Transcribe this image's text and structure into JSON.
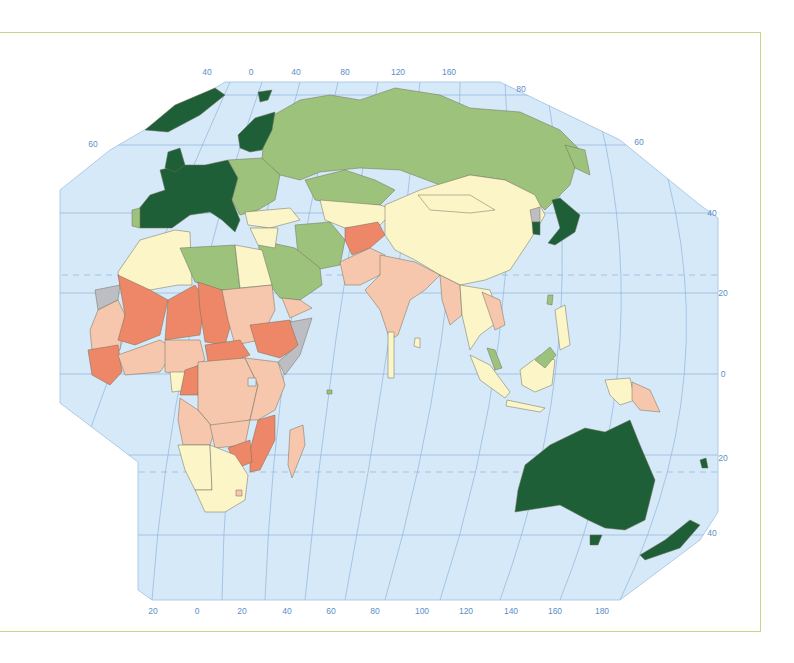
{
  "map": {
    "projection": "world map (Eastern Hemisphere, Africa / Eurasia / Oceania)",
    "colors": {
      "ocean": "#d6e9f8",
      "graticule": "#8fb4dc",
      "class_1_dark_green": "#1f5f37",
      "class_2_light_green": "#9dc27c",
      "class_3_pale_yellow": "#fbf5c8",
      "class_4_light_salmon": "#f6c6ad",
      "class_5_dark_salmon": "#ee8767",
      "no_data_grey": "#bdbec4",
      "frame_border": "#c9d48a"
    },
    "top_longitude_labels": [
      "40",
      "0",
      "40",
      "80",
      "120",
      "160"
    ],
    "bottom_longitude_labels": [
      "20",
      "0",
      "20",
      "40",
      "60",
      "80",
      "100",
      "120",
      "140",
      "160",
      "180"
    ],
    "right_latitude_labels": [
      "80",
      "60",
      "40",
      "20",
      "0",
      "20",
      "40"
    ],
    "left_latitude_labels": [
      "60"
    ],
    "regions": {
      "class_1_dark_green": [
        "Western Europe",
        "Scandinavia",
        "Greenland (partial)",
        "Svalbard",
        "Japan",
        "South Korea",
        "Australia",
        "New Zealand",
        "Israel"
      ],
      "class_2_light_green": [
        "Russia",
        "Eastern Europe",
        "Kazakhstan",
        "Libya",
        "Saudi Arabia",
        "Iran",
        "Oman",
        "Malaysia",
        "Portugal"
      ],
      "class_3_pale_yellow": [
        "China",
        "Mongolia",
        "Algeria",
        "Morocco",
        "Egypt",
        "Turkey",
        "South Africa",
        "Namibia",
        "Botswana",
        "Indonesia",
        "Thailand",
        "Gabon",
        "Central Asia"
      ],
      "class_4_light_salmon": [
        "India",
        "Pakistan",
        "Sudan",
        "Congo DR",
        "Angola",
        "Tanzania",
        "Kenya",
        "Madagascar",
        "Papua New Guinea",
        "Myanmar",
        "Senegal",
        "Nigeria"
      ],
      "class_5_dark_salmon": [
        "Afghanistan",
        "Mali",
        "Niger",
        "Chad",
        "Ethiopia",
        "Central African Rep.",
        "Mozambique",
        "Zimbabwe",
        "Guinea",
        "Sierra Leone",
        "Burkina Faso",
        "Congo"
      ],
      "no_data_grey": [
        "Western Sahara",
        "Somalia",
        "North Korea"
      ]
    }
  }
}
